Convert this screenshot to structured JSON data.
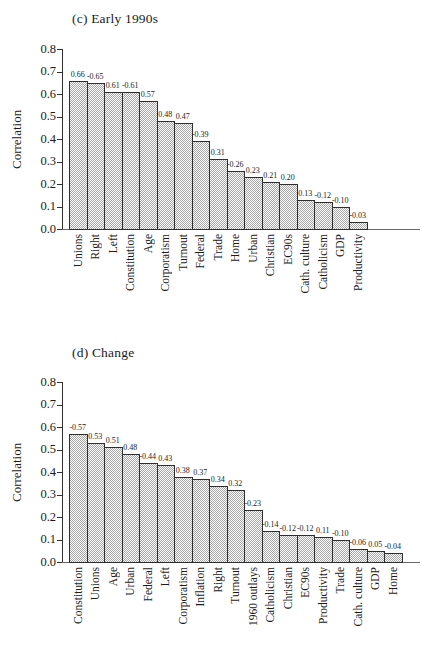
{
  "figure": {
    "panels": [
      "(c) Early 1990s",
      "(d) Change"
    ],
    "background_color": "#ffffff",
    "bar_fill_color": "#d6d6d6",
    "bar_border_color": "#2e2e2e",
    "text_color": "#1b1b1b"
  },
  "chart_data": [
    {
      "type": "bar",
      "panel": "c",
      "title": "(c) Early 1990s",
      "xlabel": "",
      "ylabel": "Correlation",
      "ylim": [
        0.0,
        0.8
      ],
      "ytick_step": 0.1,
      "grid": "off",
      "legend": "none",
      "bar_height_rule": "bars drawn at absolute value of correlation; label shows signed value",
      "categories": [
        "Unions",
        "Right",
        "Left",
        "Constitution",
        "Age",
        "Corporatism",
        "Turnout",
        "Federal",
        "Trade",
        "Home",
        "Urban",
        "Christian",
        "EC90s",
        "Cath. culture",
        "Catholicism",
        "GDP",
        "Productivity"
      ],
      "values": [
        0.66,
        -0.65,
        0.61,
        -0.61,
        0.57,
        0.48,
        0.47,
        -0.39,
        0.31,
        -0.26,
        0.23,
        0.21,
        0.2,
        0.13,
        -0.12,
        -0.1,
        -0.03
      ],
      "value_labels": [
        "0.66",
        "-0.65",
        "0.61",
        "-0.61",
        "0.57",
        "0.48",
        "0.47",
        "-0.39",
        "0.31",
        "-0.26",
        "0.23",
        "0.21",
        "0.20",
        "0.13",
        "-0.12",
        "-0.10",
        "-0.03"
      ]
    },
    {
      "type": "bar",
      "panel": "d",
      "title": "(d) Change",
      "xlabel": "",
      "ylabel": "Correlation",
      "ylim": [
        0.0,
        0.8
      ],
      "ytick_step": 0.1,
      "grid": "off",
      "legend": "none",
      "bar_height_rule": "bars drawn at absolute value of correlation; label shows signed value",
      "categories": [
        "Constitution",
        "Unions",
        "Age",
        "Urban",
        "Federal",
        "Left",
        "Corporatism",
        "Inflation",
        "Right",
        "Turnout",
        "1960 outlays",
        "Catholicism",
        "Christian",
        "EC90s",
        "Productivity",
        "Trade",
        "Cath. culture",
        "GDP",
        "Home"
      ],
      "values": [
        -0.57,
        0.53,
        0.51,
        0.48,
        -0.44,
        0.43,
        0.38,
        0.37,
        0.34,
        0.32,
        -0.23,
        -0.14,
        -0.12,
        -0.12,
        0.11,
        -0.1,
        -0.06,
        0.05,
        -0.04
      ],
      "value_labels": [
        "-0.57",
        "0.53",
        "0.51",
        "0.48",
        "-0.44",
        "0.43",
        "0.38",
        "0.37",
        "0.34",
        "0.32",
        "-0.23",
        "-0.14",
        "-0.12",
        "-0.12",
        "0.11",
        "-0.10",
        "-0.06",
        "0.05",
        "-0.04"
      ]
    }
  ]
}
